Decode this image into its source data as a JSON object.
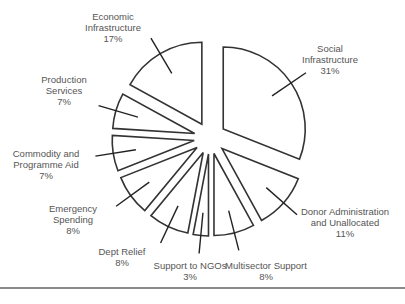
{
  "chart_data": {
    "type": "pie",
    "title": "",
    "exploded": true,
    "start_angle_deg": 0,
    "direction": "clockwise",
    "categories": [
      "Social Infrastructure",
      "Donor Administration and Unallocated",
      "Multisector Support",
      "Support to NGOs",
      "Dept Relief",
      "Emergency Spending",
      "Commodity and Programme Aid",
      "Production Services",
      "Economic Infrastructure"
    ],
    "values": [
      31,
      11,
      8,
      3,
      8,
      8,
      7,
      7,
      17
    ],
    "labels": [
      {
        "lines": [
          "Social",
          "Infrastructure",
          "31%"
        ],
        "x": 330,
        "y": 52
      },
      {
        "lines": [
          "Donor Administration",
          "and Unallocated",
          "11%"
        ],
        "x": 345,
        "y": 215
      },
      {
        "lines": [
          "Multisector Support",
          "8%"
        ],
        "x": 266,
        "y": 269
      },
      {
        "lines": [
          "Support to NGOs",
          "3%"
        ],
        "x": 190,
        "y": 269
      },
      {
        "lines": [
          "Dept Relief",
          "8%"
        ],
        "x": 122,
        "y": 255
      },
      {
        "lines": [
          "Emergency",
          "Spending",
          "8%"
        ],
        "x": 73,
        "y": 212
      },
      {
        "lines": [
          "Commodity and",
          "Programme Aid",
          "7%"
        ],
        "x": 46,
        "y": 157
      },
      {
        "lines": [
          "Production",
          "Services",
          "7%"
        ],
        "x": 64,
        "y": 83
      },
      {
        "lines": [
          "Economic",
          "Infrastructure",
          "17%"
        ],
        "x": 113,
        "y": 20
      }
    ],
    "legend": "none",
    "colors": {
      "fill": "#ffffff",
      "stroke": "#333333",
      "text": "#555555",
      "rule": "#8a8a8a"
    }
  }
}
